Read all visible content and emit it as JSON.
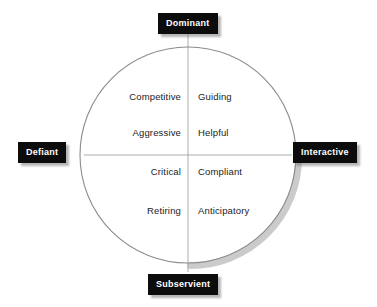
{
  "diagram": {
    "type": "interpersonal-circumplex",
    "geometry": {
      "center_x": 188,
      "center_y": 155,
      "radius": 108,
      "circle_stroke": "#8c8c8c",
      "axis_stroke": "#a8a8a8",
      "shadow_color": "#b9b9b9"
    },
    "axes": [
      {
        "id": "vertical",
        "pole_high": "Dominant",
        "pole_low": "Subservient"
      },
      {
        "id": "horizontal",
        "pole_high": "Defiant",
        "pole_low": "Interactive"
      }
    ],
    "poles": {
      "top": "Dominant",
      "bottom": "Subservient",
      "left": "Defiant",
      "right": "Interactive"
    },
    "pole_style": {
      "background": "#0c0c0c",
      "text_color": "#ffffff"
    },
    "quadrants": [
      {
        "id": "upper-left",
        "name": "Dominant-Defiant",
        "terms": [
          "Competitive",
          "Aggressive"
        ]
      },
      {
        "id": "upper-right",
        "name": "Dominant-Interactive",
        "terms": [
          "Guiding",
          "Helpful"
        ]
      },
      {
        "id": "lower-left",
        "name": "Subservient-Defiant",
        "terms": [
          "Critical",
          "Retiring"
        ]
      },
      {
        "id": "lower-right",
        "name": "Subservient-Interactive",
        "terms": [
          "Compliant",
          "Anticipatory"
        ]
      }
    ]
  }
}
